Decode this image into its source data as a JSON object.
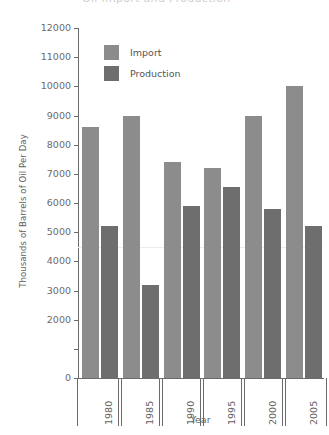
{
  "chart_data": {
    "type": "bar",
    "title": "",
    "xlabel": "Year",
    "ylabel": "Thousands of Barrels of Oil Per Day",
    "categories": [
      "1980",
      "1985",
      "1990",
      "1995",
      "2000",
      "2005"
    ],
    "series": [
      {
        "name": "Import",
        "color": "#8c8c8c",
        "values": [
          8600,
          9000,
          7400,
          7200,
          9000,
          10000
        ]
      },
      {
        "name": "Production",
        "color": "#6e6e6e",
        "values": [
          5200,
          3200,
          5900,
          6550,
          5800,
          5200
        ]
      }
    ],
    "ylim": [
      0,
      12000
    ],
    "ytick_values": [
      0,
      1000,
      2000,
      3000,
      4000,
      5000,
      6000,
      7000,
      8000,
      9000,
      10000,
      11000,
      12000
    ],
    "ytick_labels": [
      "0",
      "",
      "2000",
      "3000",
      "4000",
      "5000",
      "6000",
      "7000",
      "8000",
      "9000",
      "10000",
      "11000",
      "12000"
    ],
    "grid": false,
    "legend_position": "top-left-inside"
  },
  "axes": {
    "y_title": "Thousands of Barrels of Oil Per Day",
    "x_title": "Year"
  },
  "legend": {
    "entries": [
      {
        "label": "Import",
        "swatch": "import-swatch"
      },
      {
        "label": "Production",
        "swatch": "production-swatch"
      }
    ]
  },
  "header": {
    "cropped_title": "Oil Import and Production"
  }
}
